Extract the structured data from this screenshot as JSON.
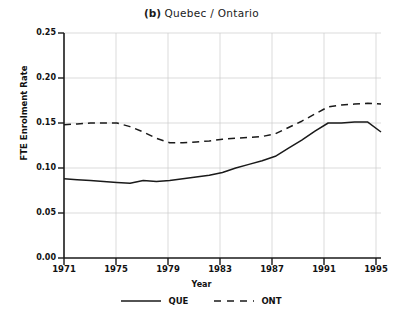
{
  "figure": {
    "panel_tag": "(b)",
    "title": "Quebec / Ontario",
    "ylabel": "FTE Enrolment Rate",
    "xlabel": "Year"
  },
  "legend": {
    "items": [
      {
        "label": "QUE",
        "style": "solid"
      },
      {
        "label": "ONT",
        "style": "dashed"
      }
    ]
  },
  "axis": {
    "yticks": [
      "0.00",
      "0.05",
      "0.10",
      "0.15",
      "0.20",
      "0.25"
    ],
    "xticks": [
      "1971",
      "1975",
      "1979",
      "1983",
      "1987",
      "1991",
      "1995"
    ]
  },
  "chart_data": {
    "type": "line",
    "title": "(b) Quebec / Ontario",
    "xlabel": "Year",
    "ylabel": "FTE Enrolment Rate",
    "xlim": [
      1971,
      1995
    ],
    "ylim": [
      0.0,
      0.25
    ],
    "ytick_values": [
      0.0,
      0.05,
      0.1,
      0.15,
      0.2,
      0.25
    ],
    "xtick_values": [
      1971,
      1975,
      1979,
      1983,
      1987,
      1991,
      1995
    ],
    "grid": true,
    "legend_position": "below",
    "x": [
      1971,
      1972,
      1973,
      1974,
      1975,
      1976,
      1977,
      1978,
      1979,
      1980,
      1981,
      1982,
      1983,
      1984,
      1985,
      1986,
      1987,
      1988,
      1989,
      1990,
      1991,
      1992,
      1993,
      1994,
      1995
    ],
    "series": [
      {
        "name": "QUE",
        "style": "solid",
        "color": "#1a1a1a",
        "values": [
          0.088,
          0.087,
          0.086,
          0.085,
          0.084,
          0.083,
          0.086,
          0.085,
          0.086,
          0.088,
          0.09,
          0.092,
          0.095,
          0.1,
          0.104,
          0.108,
          0.113,
          0.122,
          0.131,
          0.141,
          0.15,
          0.15,
          0.151,
          0.151,
          0.14
        ]
      },
      {
        "name": "ONT",
        "style": "dashed",
        "color": "#1a1a1a",
        "values": [
          0.148,
          0.149,
          0.15,
          0.15,
          0.15,
          0.146,
          0.14,
          0.133,
          0.128,
          0.128,
          0.129,
          0.13,
          0.132,
          0.133,
          0.134,
          0.135,
          0.138,
          0.145,
          0.152,
          0.16,
          0.168,
          0.17,
          0.171,
          0.172,
          0.171
        ]
      }
    ]
  }
}
